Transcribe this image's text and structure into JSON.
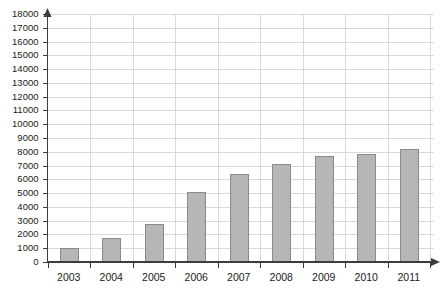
{
  "chart_data": {
    "type": "bar",
    "title": "",
    "subtitle": "",
    "xlabel": "",
    "ylabel": "",
    "categories": [
      "2003",
      "2004",
      "2005",
      "2006",
      "2007",
      "2008",
      "2009",
      "2010",
      "2011"
    ],
    "values": [
      1000,
      1750,
      2750,
      5100,
      6400,
      7100,
      7700,
      7850,
      8200
    ],
    "series": [
      {
        "name": "",
        "values": [
          1000,
          1750,
          2750,
          5100,
          6400,
          7100,
          7700,
          7850,
          8200
        ]
      }
    ],
    "ylim": [
      0,
      18000
    ],
    "ytick_step": 1000,
    "ytick_labels": [
      "0",
      "1000",
      "2000",
      "3000",
      "4000",
      "5000",
      "6000",
      "7000",
      "8000",
      "9000",
      "10000",
      "11000",
      "12000",
      "13000",
      "14000",
      "15000",
      "16000",
      "17000",
      "18000"
    ],
    "xtick_labels": [
      "2003",
      "2004",
      "2005",
      "2006",
      "2007",
      "2008",
      "2009",
      "2010",
      "2011"
    ],
    "grid": true,
    "grid_horizontal": true,
    "grid_vertical": true,
    "legend": false,
    "legend_position": "none",
    "annotations": [],
    "colors": {
      "bar_fill": "#b6b6b6",
      "bar_stroke": "#8a8a8a",
      "gridline": "#d9d9d9",
      "axis": "#3d3d3d",
      "text": "#1a1a1a",
      "background": "#ffffff"
    }
  }
}
